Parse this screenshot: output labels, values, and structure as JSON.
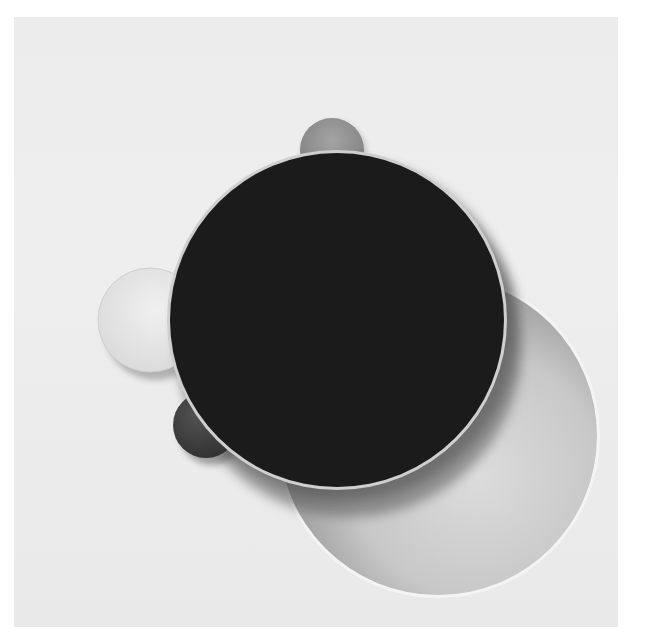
{
  "artwork": {
    "subject": "Abstract relief of overlapping circles on a white panel",
    "palette": {
      "background": "#ffffff",
      "panel": "#ebebeb",
      "black_disc": "#1b1b1b",
      "cutout_shadow": "#9a9a9a",
      "cutout_light": "#d6d6d6",
      "white_disc": "#e6e6e6",
      "gray_disc_top": "#8e8e8e",
      "dark_disc_bottom": "#3c3c3c"
    },
    "shapes": [
      {
        "name": "large-black-disc",
        "cx": 337,
        "cy": 320,
        "r": 168
      },
      {
        "name": "circular-cutout",
        "cx": 438,
        "cy": 436,
        "r": 160
      },
      {
        "name": "white-disc-left",
        "cx": 150,
        "cy": 320,
        "r": 52
      },
      {
        "name": "gray-disc-top",
        "cx": 332,
        "cy": 150,
        "r": 32
      },
      {
        "name": "dark-disc-bottom-left",
        "cx": 206,
        "cy": 425,
        "r": 33
      }
    ]
  }
}
